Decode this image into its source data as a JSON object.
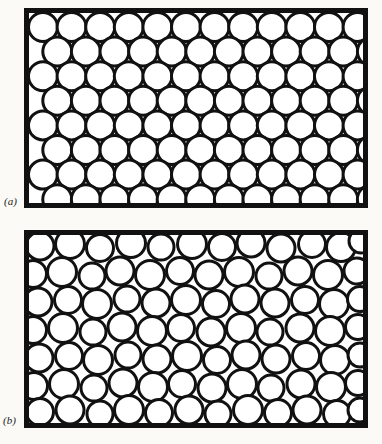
{
  "figure": {
    "kind": "two-panel-line-drawing",
    "background_color": "#fbfaf7",
    "ink_color": "#111111",
    "sphere_fill_color": "#ffffff",
    "canvas": {
      "width": 382,
      "height": 444
    }
  },
  "panels": [
    {
      "id": "panel-a",
      "label": "(a)",
      "label_position": {
        "x": 4,
        "y": 196
      },
      "structure": "crystalline",
      "frame": {
        "x": 24,
        "y": 8,
        "width": 344,
        "height": 200,
        "stroke_width": 5
      },
      "packing": {
        "arrangement": "hexagonal close packed rows",
        "circle_diameter": 29,
        "circle_stroke_width": 3,
        "rows": 8,
        "columns_long_row": 12,
        "columns_short_row": 12,
        "row_pitch": 24.6,
        "column_pitch": 28.6,
        "row_offset": 14.3
      }
    },
    {
      "id": "panel-b",
      "label": "(b)",
      "label_position": {
        "x": 3,
        "y": 415
      },
      "structure": "amorphous",
      "frame": {
        "x": 24,
        "y": 230,
        "width": 344,
        "height": 198,
        "stroke_width": 5
      },
      "packing": {
        "arrangement": "random disordered",
        "circle_diameter_min": 24,
        "circle_diameter_max": 30,
        "circle_stroke_width": 3,
        "count": 118
      },
      "circles": [
        {
          "cx": 40,
          "cy": 246,
          "r": 14
        },
        {
          "cx": 70,
          "cy": 244,
          "r": 14.5
        },
        {
          "cx": 100,
          "cy": 248,
          "r": 13.5
        },
        {
          "cx": 131,
          "cy": 243,
          "r": 14.5
        },
        {
          "cx": 161,
          "cy": 247,
          "r": 13
        },
        {
          "cx": 192,
          "cy": 244,
          "r": 14.5
        },
        {
          "cx": 222,
          "cy": 247,
          "r": 13.5
        },
        {
          "cx": 251,
          "cy": 243,
          "r": 14
        },
        {
          "cx": 281,
          "cy": 248,
          "r": 14
        },
        {
          "cx": 312,
          "cy": 244,
          "r": 13.5
        },
        {
          "cx": 341,
          "cy": 247,
          "r": 14.5
        },
        {
          "cx": 361,
          "cy": 241,
          "r": 12
        },
        {
          "cx": 33,
          "cy": 274,
          "r": 13.5
        },
        {
          "cx": 62,
          "cy": 272,
          "r": 14.5
        },
        {
          "cx": 92,
          "cy": 276,
          "r": 13
        },
        {
          "cx": 120,
          "cy": 271,
          "r": 14
        },
        {
          "cx": 150,
          "cy": 275,
          "r": 14.5
        },
        {
          "cx": 180,
          "cy": 271,
          "r": 13.5
        },
        {
          "cx": 209,
          "cy": 275,
          "r": 14
        },
        {
          "cx": 239,
          "cy": 272,
          "r": 14.5
        },
        {
          "cx": 269,
          "cy": 276,
          "r": 13
        },
        {
          "cx": 298,
          "cy": 271,
          "r": 14
        },
        {
          "cx": 328,
          "cy": 275,
          "r": 14.5
        },
        {
          "cx": 357,
          "cy": 271,
          "r": 13
        },
        {
          "cx": 38,
          "cy": 302,
          "r": 14
        },
        {
          "cx": 68,
          "cy": 300,
          "r": 13.5
        },
        {
          "cx": 97,
          "cy": 304,
          "r": 14.5
        },
        {
          "cx": 127,
          "cy": 299,
          "r": 13
        },
        {
          "cx": 156,
          "cy": 303,
          "r": 14
        },
        {
          "cx": 186,
          "cy": 300,
          "r": 14.5
        },
        {
          "cx": 216,
          "cy": 304,
          "r": 13.5
        },
        {
          "cx": 245,
          "cy": 299,
          "r": 14
        },
        {
          "cx": 275,
          "cy": 303,
          "r": 14
        },
        {
          "cx": 305,
          "cy": 300,
          "r": 13.5
        },
        {
          "cx": 334,
          "cy": 304,
          "r": 14.5
        },
        {
          "cx": 360,
          "cy": 299,
          "r": 12.5
        },
        {
          "cx": 33,
          "cy": 330,
          "r": 13.5
        },
        {
          "cx": 63,
          "cy": 328,
          "r": 14.5
        },
        {
          "cx": 93,
          "cy": 332,
          "r": 13
        },
        {
          "cx": 122,
          "cy": 327,
          "r": 14
        },
        {
          "cx": 152,
          "cy": 331,
          "r": 14.5
        },
        {
          "cx": 181,
          "cy": 328,
          "r": 13.5
        },
        {
          "cx": 211,
          "cy": 332,
          "r": 14
        },
        {
          "cx": 241,
          "cy": 328,
          "r": 14.5
        },
        {
          "cx": 270,
          "cy": 332,
          "r": 13
        },
        {
          "cx": 300,
          "cy": 328,
          "r": 14
        },
        {
          "cx": 330,
          "cy": 331,
          "r": 14.5
        },
        {
          "cx": 358,
          "cy": 327,
          "r": 12.5
        },
        {
          "cx": 39,
          "cy": 358,
          "r": 14
        },
        {
          "cx": 69,
          "cy": 356,
          "r": 13.5
        },
        {
          "cx": 98,
          "cy": 360,
          "r": 14.5
        },
        {
          "cx": 128,
          "cy": 355,
          "r": 13
        },
        {
          "cx": 157,
          "cy": 359,
          "r": 14
        },
        {
          "cx": 187,
          "cy": 356,
          "r": 14.5
        },
        {
          "cx": 217,
          "cy": 360,
          "r": 13.5
        },
        {
          "cx": 246,
          "cy": 355,
          "r": 14
        },
        {
          "cx": 276,
          "cy": 359,
          "r": 14
        },
        {
          "cx": 306,
          "cy": 356,
          "r": 13.5
        },
        {
          "cx": 335,
          "cy": 360,
          "r": 14.5
        },
        {
          "cx": 360,
          "cy": 355,
          "r": 12
        },
        {
          "cx": 34,
          "cy": 386,
          "r": 13.5
        },
        {
          "cx": 64,
          "cy": 384,
          "r": 14.5
        },
        {
          "cx": 94,
          "cy": 388,
          "r": 13
        },
        {
          "cx": 123,
          "cy": 383,
          "r": 14
        },
        {
          "cx": 153,
          "cy": 387,
          "r": 14.5
        },
        {
          "cx": 182,
          "cy": 384,
          "r": 13.5
        },
        {
          "cx": 212,
          "cy": 388,
          "r": 14
        },
        {
          "cx": 242,
          "cy": 384,
          "r": 14.5
        },
        {
          "cx": 271,
          "cy": 388,
          "r": 13
        },
        {
          "cx": 301,
          "cy": 384,
          "r": 14
        },
        {
          "cx": 331,
          "cy": 387,
          "r": 14.5
        },
        {
          "cx": 358,
          "cy": 383,
          "r": 12.5
        },
        {
          "cx": 40,
          "cy": 412,
          "r": 13.5
        },
        {
          "cx": 70,
          "cy": 410,
          "r": 14
        },
        {
          "cx": 100,
          "cy": 414,
          "r": 13
        },
        {
          "cx": 129,
          "cy": 410,
          "r": 14.5
        },
        {
          "cx": 159,
          "cy": 413,
          "r": 13.5
        },
        {
          "cx": 189,
          "cy": 410,
          "r": 14
        },
        {
          "cx": 218,
          "cy": 414,
          "r": 13
        },
        {
          "cx": 248,
          "cy": 410,
          "r": 14.5
        },
        {
          "cx": 278,
          "cy": 413,
          "r": 13.5
        },
        {
          "cx": 307,
          "cy": 410,
          "r": 14
        },
        {
          "cx": 337,
          "cy": 414,
          "r": 13.5
        },
        {
          "cx": 360,
          "cy": 410,
          "r": 12
        }
      ]
    }
  ]
}
